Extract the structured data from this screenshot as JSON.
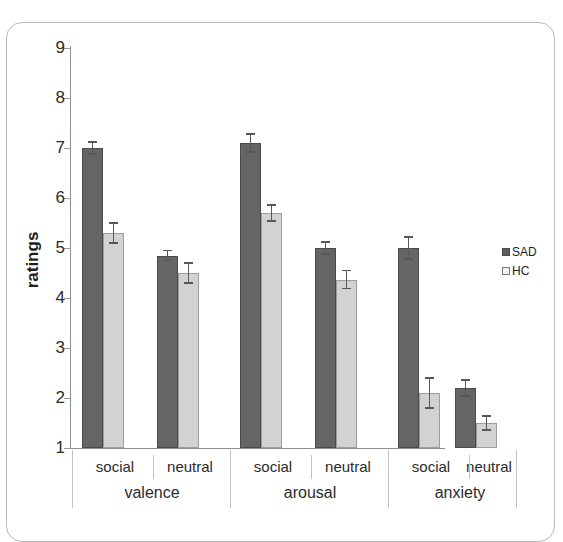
{
  "chart_data": {
    "type": "bar",
    "title": "",
    "xlabel": "",
    "ylabel": "ratings",
    "ylim": [
      1,
      9
    ],
    "yticks": [
      9,
      8,
      7,
      6,
      5,
      4,
      3,
      2,
      1
    ],
    "grid": false,
    "legend_position": "right",
    "groups": [
      {
        "name": "valence",
        "subcategories": [
          "social",
          "neutral"
        ]
      },
      {
        "name": "arousal",
        "subcategories": [
          "social",
          "neutral"
        ]
      },
      {
        "name": "anxiety",
        "subcategories": [
          "social",
          "neutral"
        ]
      }
    ],
    "categories": [
      "valence-social",
      "valence-neutral",
      "arousal-social",
      "arousal-neutral",
      "anxiety-social",
      "anxiety-neutral"
    ],
    "series": [
      {
        "name": "SAD",
        "color": "#656565",
        "values": [
          7.0,
          4.85,
          7.1,
          5.0,
          5.0,
          2.2
        ],
        "errors": [
          0.12,
          0.1,
          0.18,
          0.12,
          0.22,
          0.16
        ]
      },
      {
        "name": "HC",
        "color": "#d2d2d2",
        "values": [
          5.3,
          4.5,
          5.7,
          4.37,
          2.1,
          1.5
        ],
        "errors": [
          0.2,
          0.2,
          0.16,
          0.18,
          0.3,
          0.14
        ]
      }
    ]
  },
  "axis": {
    "y_title": "ratings",
    "tick_labels": [
      "9",
      "8",
      "7",
      "6",
      "5",
      "4",
      "3",
      "2",
      "1"
    ],
    "sub_labels": [
      "social",
      "neutral",
      "social",
      "neutral",
      "social",
      "neutral"
    ],
    "group_labels": [
      "valence",
      "arousal",
      "anxiety"
    ]
  },
  "legend": {
    "items": [
      {
        "label": "SAD",
        "swatch": "dark-square-icon"
      },
      {
        "label": "HC",
        "swatch": "light-square-icon"
      }
    ]
  }
}
